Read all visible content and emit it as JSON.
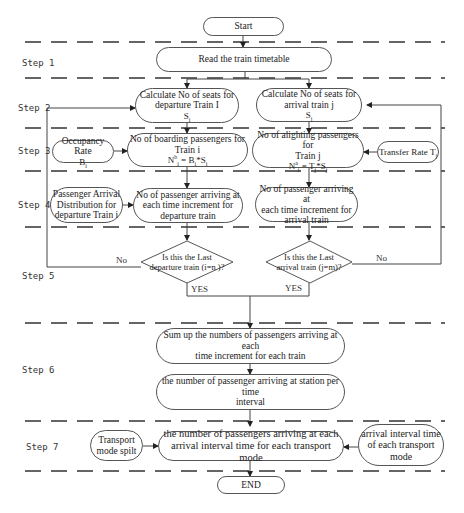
{
  "diagram": {
    "type": "flowchart",
    "steps": [
      {
        "id": "step1",
        "label": "Step 1"
      },
      {
        "id": "step2",
        "label": "Step 2"
      },
      {
        "id": "step3",
        "label": "Step 3"
      },
      {
        "id": "step4",
        "label": "Step 4"
      },
      {
        "id": "step5",
        "label": "Step 5"
      },
      {
        "id": "step6",
        "label": "Step 6"
      },
      {
        "id": "step7",
        "label": "Step 7"
      }
    ],
    "nodes": {
      "start": {
        "text": "Start"
      },
      "read_timetable": {
        "text": "Read the train timetable"
      },
      "calc_seats_departure": {
        "line1": "Calculate No of seats for",
        "line2": "departure Train I",
        "symbol": "S",
        "sub": "i"
      },
      "calc_seats_arrival": {
        "line1": "Calculate No of seats for",
        "line2": "arrival train j",
        "symbol": "S",
        "sub": "j"
      },
      "occupancy_rate": {
        "line1": "Occupancy Rate",
        "symbol": "B",
        "sub": "i"
      },
      "boarding_passengers": {
        "line1": "No of boarding passengers for",
        "line2": "Train i",
        "formula_lhs": "N",
        "formula_sup": "b",
        "formula_sub": "i",
        "formula_rhs_a": " = B",
        "formula_rhs_a_sub": "i",
        "formula_rhs_b": "*S",
        "formula_rhs_b_sub": "i"
      },
      "alighting_passengers": {
        "line1": "No of alighting passengers for",
        "line2": "Train j",
        "formula_lhs": "N",
        "formula_sup": "a",
        "formula_sub": "i",
        "formula_rhs_a": " = T",
        "formula_rhs_a_sub": "j",
        "formula_rhs_b": "*S",
        "formula_rhs_b_sub": "j"
      },
      "transfer_rate": {
        "line1": "Transfer Rate T",
        "sub": "j"
      },
      "arrival_distribution": {
        "line1": "Passenger Arrival",
        "line2": "Distribution for",
        "line3": "departure Train i"
      },
      "arriving_departure": {
        "line1": "No of passenger arriving at",
        "line2": "each time increment for",
        "line3": "departure train"
      },
      "arriving_arrival": {
        "line1": "No of passenger arriving at",
        "line2": "each time increment for",
        "line3": "arrival train"
      },
      "last_departure": {
        "line1": "Is this the Last",
        "line2": "departure train (i=n )?"
      },
      "last_arrival": {
        "line1": "Is this the Last",
        "line2": "arrival train (j=m)?"
      },
      "sum_up": {
        "line1": "Sum up the numbers of passengers arriving at each",
        "line2": "time increment for each train"
      },
      "station_per_interval": {
        "line1": "the number of passenger arriving at station per time",
        "line2": "interval"
      },
      "transport_mode_split": {
        "line1": "Transport",
        "line2": "mode spilt"
      },
      "per_transport_mode": {
        "line1": "the number of passengers arriving at each",
        "line2": "arrival interval time for each transport mode"
      },
      "arrival_interval_time": {
        "line1": "arrival interval time",
        "line2": "of each transport",
        "line3": "mode"
      },
      "end": {
        "text": "END"
      }
    },
    "edge_labels": {
      "no_left": "No",
      "no_right": "No",
      "yes_left": "YES",
      "yes_right": "YES"
    },
    "colors": {
      "line": "#444444",
      "dash": "#333333",
      "text": "#222222",
      "background": "#ffffff"
    }
  }
}
